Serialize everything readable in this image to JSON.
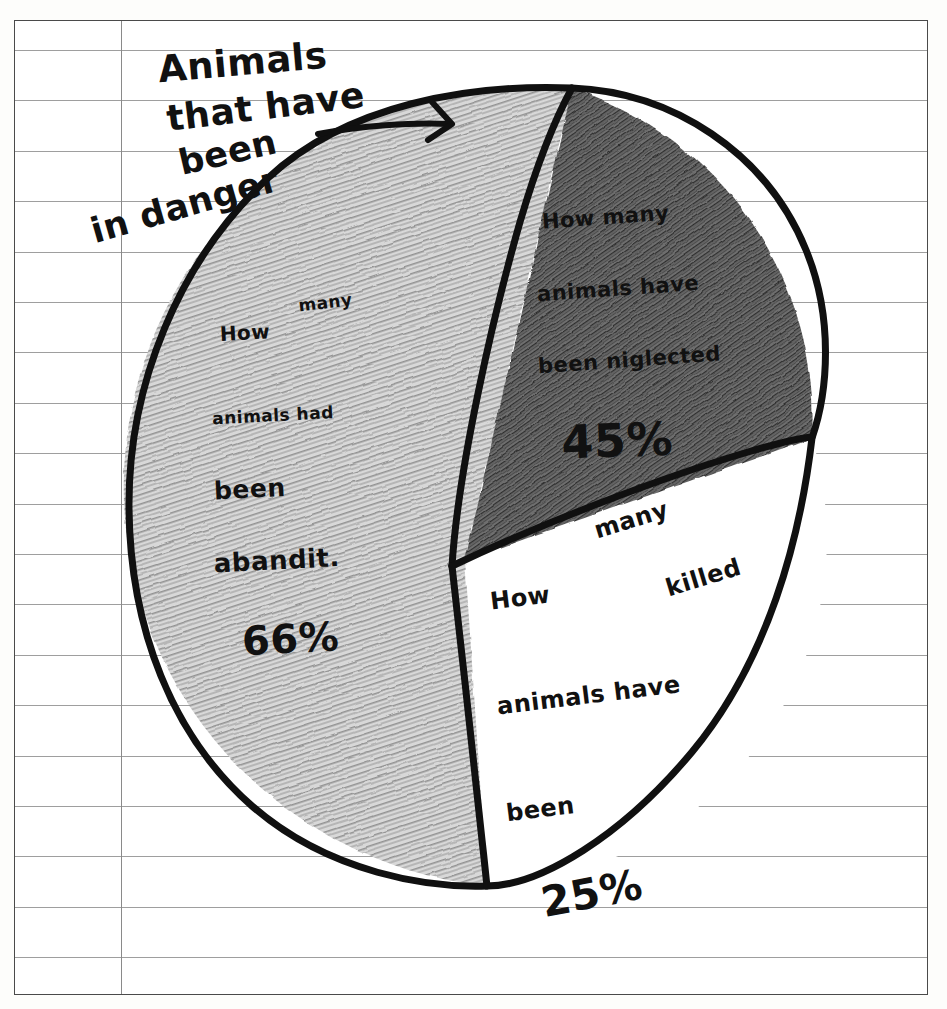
{
  "page": {
    "medium": "lined notebook paper",
    "paper_color": "#ffffff",
    "rule_color": "#8d8d8d",
    "margin_color": "#8a8a8a",
    "ink_color": "#111111"
  },
  "title": {
    "full": "Animals that have been in danger",
    "line1": "Animals",
    "line2": "that have",
    "line3": "been",
    "line4": "in danger"
  },
  "labels": {
    "neglected": {
      "line1": "How many",
      "line2": "animals have",
      "line3": "been niglected",
      "value": "45%"
    },
    "abandoned": {
      "line1": "How",
      "line1b": "many",
      "line2": "animals had",
      "line3": "been",
      "line4": "abandit.",
      "value": "66%"
    },
    "killed": {
      "line1": "How",
      "line1b": "many",
      "line2": "animals have",
      "line2b": "killed",
      "line3": "been",
      "value": "25%"
    }
  },
  "chart_data": {
    "type": "pie",
    "title": "Animals that have been in danger",
    "categories": [
      "How many animals had been abandit.",
      "How many animals have been niglected",
      "How many animals have been killed"
    ],
    "values": [
      66,
      45,
      25
    ],
    "value_labels": [
      "66%",
      "45%",
      "25%"
    ],
    "note": "Hand-drawn pie; stated percentages sum to 136% and do not match the drawn slice angles.",
    "slices": [
      {
        "name": "abandit",
        "label": "How many animals had been abandit.",
        "value": 66,
        "value_label": "66%",
        "fill": "hatched-light-pencil",
        "fill_color": "#b9b9b9",
        "start_angle_deg": 180,
        "end_angle_deg": 360,
        "drawn_fraction": 0.5
      },
      {
        "name": "niglected",
        "label": "How many animals have been niglected",
        "value": 45,
        "value_label": "45%",
        "fill": "dark-pencil-shading",
        "fill_color": "#5d5d5d",
        "start_angle_deg": 0,
        "end_angle_deg": 80,
        "drawn_fraction": 0.22
      },
      {
        "name": "killed",
        "label": "How many animals have been killed",
        "value": 25,
        "value_label": "25%",
        "fill": "white-unshaded",
        "fill_color": "#ffffff",
        "start_angle_deg": 80,
        "end_angle_deg": 180,
        "drawn_fraction": 0.28
      }
    ],
    "legend": "none (labels written inside slices)",
    "grid": false,
    "annotations": [
      {
        "name": "title-arrow",
        "text": "",
        "description": "arrow drawn from the title toward the pie"
      }
    ]
  }
}
